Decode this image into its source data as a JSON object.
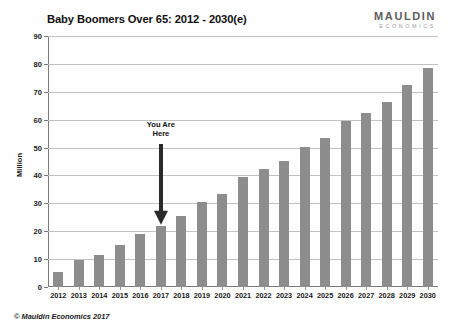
{
  "header": {
    "title": "Baby Boomers Over 65: 2012 - 2030(e)",
    "brand_name": "MAULDIN",
    "brand_sub": "ECONOMICS"
  },
  "footer": {
    "copyright": "© Mauldin Economics 2017"
  },
  "annotation": {
    "line1": "You Are",
    "line2": "Here",
    "target_category": "2017"
  },
  "style": {
    "bar_color": "#8d8d8d",
    "grid_color": "#c2c2c2",
    "axis_color": "#7a7a7a",
    "arrow_color": "#2a2a2a",
    "text_color": "#1b1b1b"
  },
  "chart_data": {
    "type": "bar",
    "title": "Baby Boomers Over 65: 2012 - 2030(e)",
    "xlabel": "",
    "ylabel": "Million",
    "ylim": [
      0,
      90
    ],
    "yticks": [
      0,
      10,
      20,
      30,
      40,
      50,
      60,
      70,
      80,
      90
    ],
    "grid": true,
    "legend": "none",
    "categories": [
      "2012",
      "2013",
      "2014",
      "2015",
      "2016",
      "2017",
      "2018",
      "2019",
      "2020",
      "2021",
      "2022",
      "2023",
      "2024",
      "2025",
      "2026",
      "2027",
      "2028",
      "2029",
      "2030"
    ],
    "values": [
      5.5,
      9.8,
      11.4,
      15.2,
      18.9,
      22.0,
      25.6,
      30.4,
      33.3,
      39.3,
      42.3,
      45.1,
      50.3,
      53.5,
      59.5,
      62.3,
      66.5,
      72.3,
      78.5
    ],
    "annotations": [
      {
        "text": "You Are Here",
        "at_category": "2017"
      }
    ]
  }
}
